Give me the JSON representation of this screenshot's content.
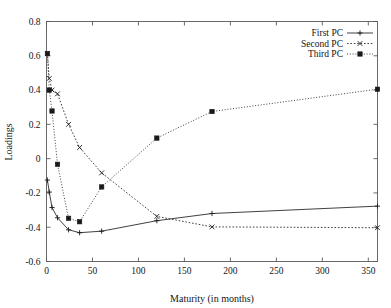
{
  "chart_data": {
    "type": "line",
    "title": "",
    "xlabel": "Maturity (in months)",
    "ylabel": "Loadings",
    "xlim": [
      0,
      360
    ],
    "ylim": [
      -0.6,
      0.8
    ],
    "xticks": [
      0,
      50,
      100,
      150,
      200,
      250,
      300,
      350
    ],
    "yticks": [
      -0.6,
      -0.4,
      -0.2,
      0,
      0.2,
      0.4,
      0.6,
      0.8
    ],
    "xtick_labels": [
      "0",
      "50",
      "100",
      "150",
      "200",
      "250",
      "300",
      "350"
    ],
    "ytick_labels": [
      "-0.6",
      "-0.4",
      "-0.2",
      "0",
      "0.2",
      "0.4",
      "0.6",
      "0.8"
    ],
    "grid": false,
    "legend_position": "top-right",
    "x": [
      1,
      3,
      6,
      12,
      24,
      36,
      60,
      120,
      180,
      360
    ],
    "series": [
      {
        "name": "First PC",
        "line_style": "solid",
        "marker": "plus",
        "values": [
          -0.125,
          -0.195,
          -0.285,
          -0.345,
          -0.415,
          -0.432,
          -0.423,
          -0.362,
          -0.32,
          -0.277
        ]
      },
      {
        "name": "Second PC",
        "line_style": "dashed",
        "marker": "cross",
        "values": [
          0.613,
          0.468,
          0.4,
          0.378,
          0.2,
          0.065,
          -0.083,
          -0.337,
          -0.398,
          -0.403
        ]
      },
      {
        "name": "Third PC",
        "line_style": "dotted",
        "marker": "filled-square",
        "values": [
          0.613,
          0.4,
          0.278,
          -0.033,
          -0.348,
          -0.368,
          -0.165,
          0.12,
          0.275,
          0.405
        ]
      }
    ]
  },
  "legend": {
    "entries": [
      {
        "label": "First PC"
      },
      {
        "label": "Second PC"
      },
      {
        "label": "Third PC"
      }
    ]
  },
  "colors": {
    "background": "#ffffff",
    "axis": "#5a5a5a",
    "ink": "#1a1a1a"
  }
}
